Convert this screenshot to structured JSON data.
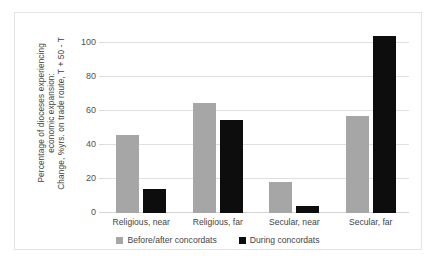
{
  "chart_data": {
    "type": "bar",
    "title": "",
    "xlabel": "",
    "ylabel": "Percentage of dioceses experiencing economic expansion: Change, %yrs. on trade route, T + 50 - T",
    "ylabel_lines": [
      "Percentage of dioceses experiencing",
      "economic expansion:",
      "Change, %yrs. on trade route, T + 50 - T"
    ],
    "categories": [
      "Religious, near",
      "Religious, far",
      "Secular, near",
      "Secular, far"
    ],
    "series": [
      {
        "name": "Before/after concordats",
        "color": "#a6a6a6",
        "values": [
          46,
          65,
          18,
          57
        ]
      },
      {
        "name": "During concordats",
        "color": "#0d0d0d",
        "values": [
          14,
          55,
          4,
          104
        ]
      }
    ],
    "ylim": [
      0,
      110
    ],
    "yticks": [
      0,
      20,
      40,
      60,
      80,
      100
    ],
    "ytick_labels": [
      "0",
      "20",
      "40",
      "60",
      "80",
      "100"
    ],
    "grid": true,
    "legend_position": "bottom"
  }
}
